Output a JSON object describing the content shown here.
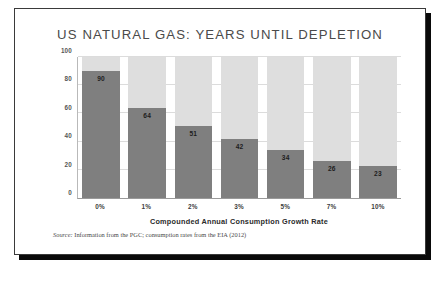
{
  "figure": {
    "title": "US NATURAL GAS: YEARS UNTIL DEPLETION",
    "source_label": "Source:",
    "source_text": "Information from the PGC; consumption rates from the EIA (2012)"
  },
  "colors": {
    "bar_fill": "#7f7f7f",
    "bar_background": "#dedede",
    "gridline": "#dcdcdc",
    "title_text": "#4a4a4a",
    "frame_shadow": "#0a0a0a"
  },
  "chart_data": {
    "type": "bar",
    "title": "US NATURAL GAS: YEARS UNTIL DEPLETION",
    "xlabel": "Compounded Annual Consumption Growth Rate",
    "ylabel": "YEARS FROM 2012",
    "categories": [
      "0%",
      "1%",
      "2%",
      "3%",
      "5%",
      "7%",
      "10%"
    ],
    "values": [
      90,
      64,
      51,
      42,
      34,
      26,
      23
    ],
    "ylim": [
      0,
      100
    ],
    "yticks": [
      0,
      20,
      40,
      60,
      80,
      100
    ],
    "ytick_labels": [
      "0",
      "20",
      "40",
      "60",
      "80",
      "100"
    ],
    "grid": true,
    "legend": "none",
    "data_labels": true
  }
}
